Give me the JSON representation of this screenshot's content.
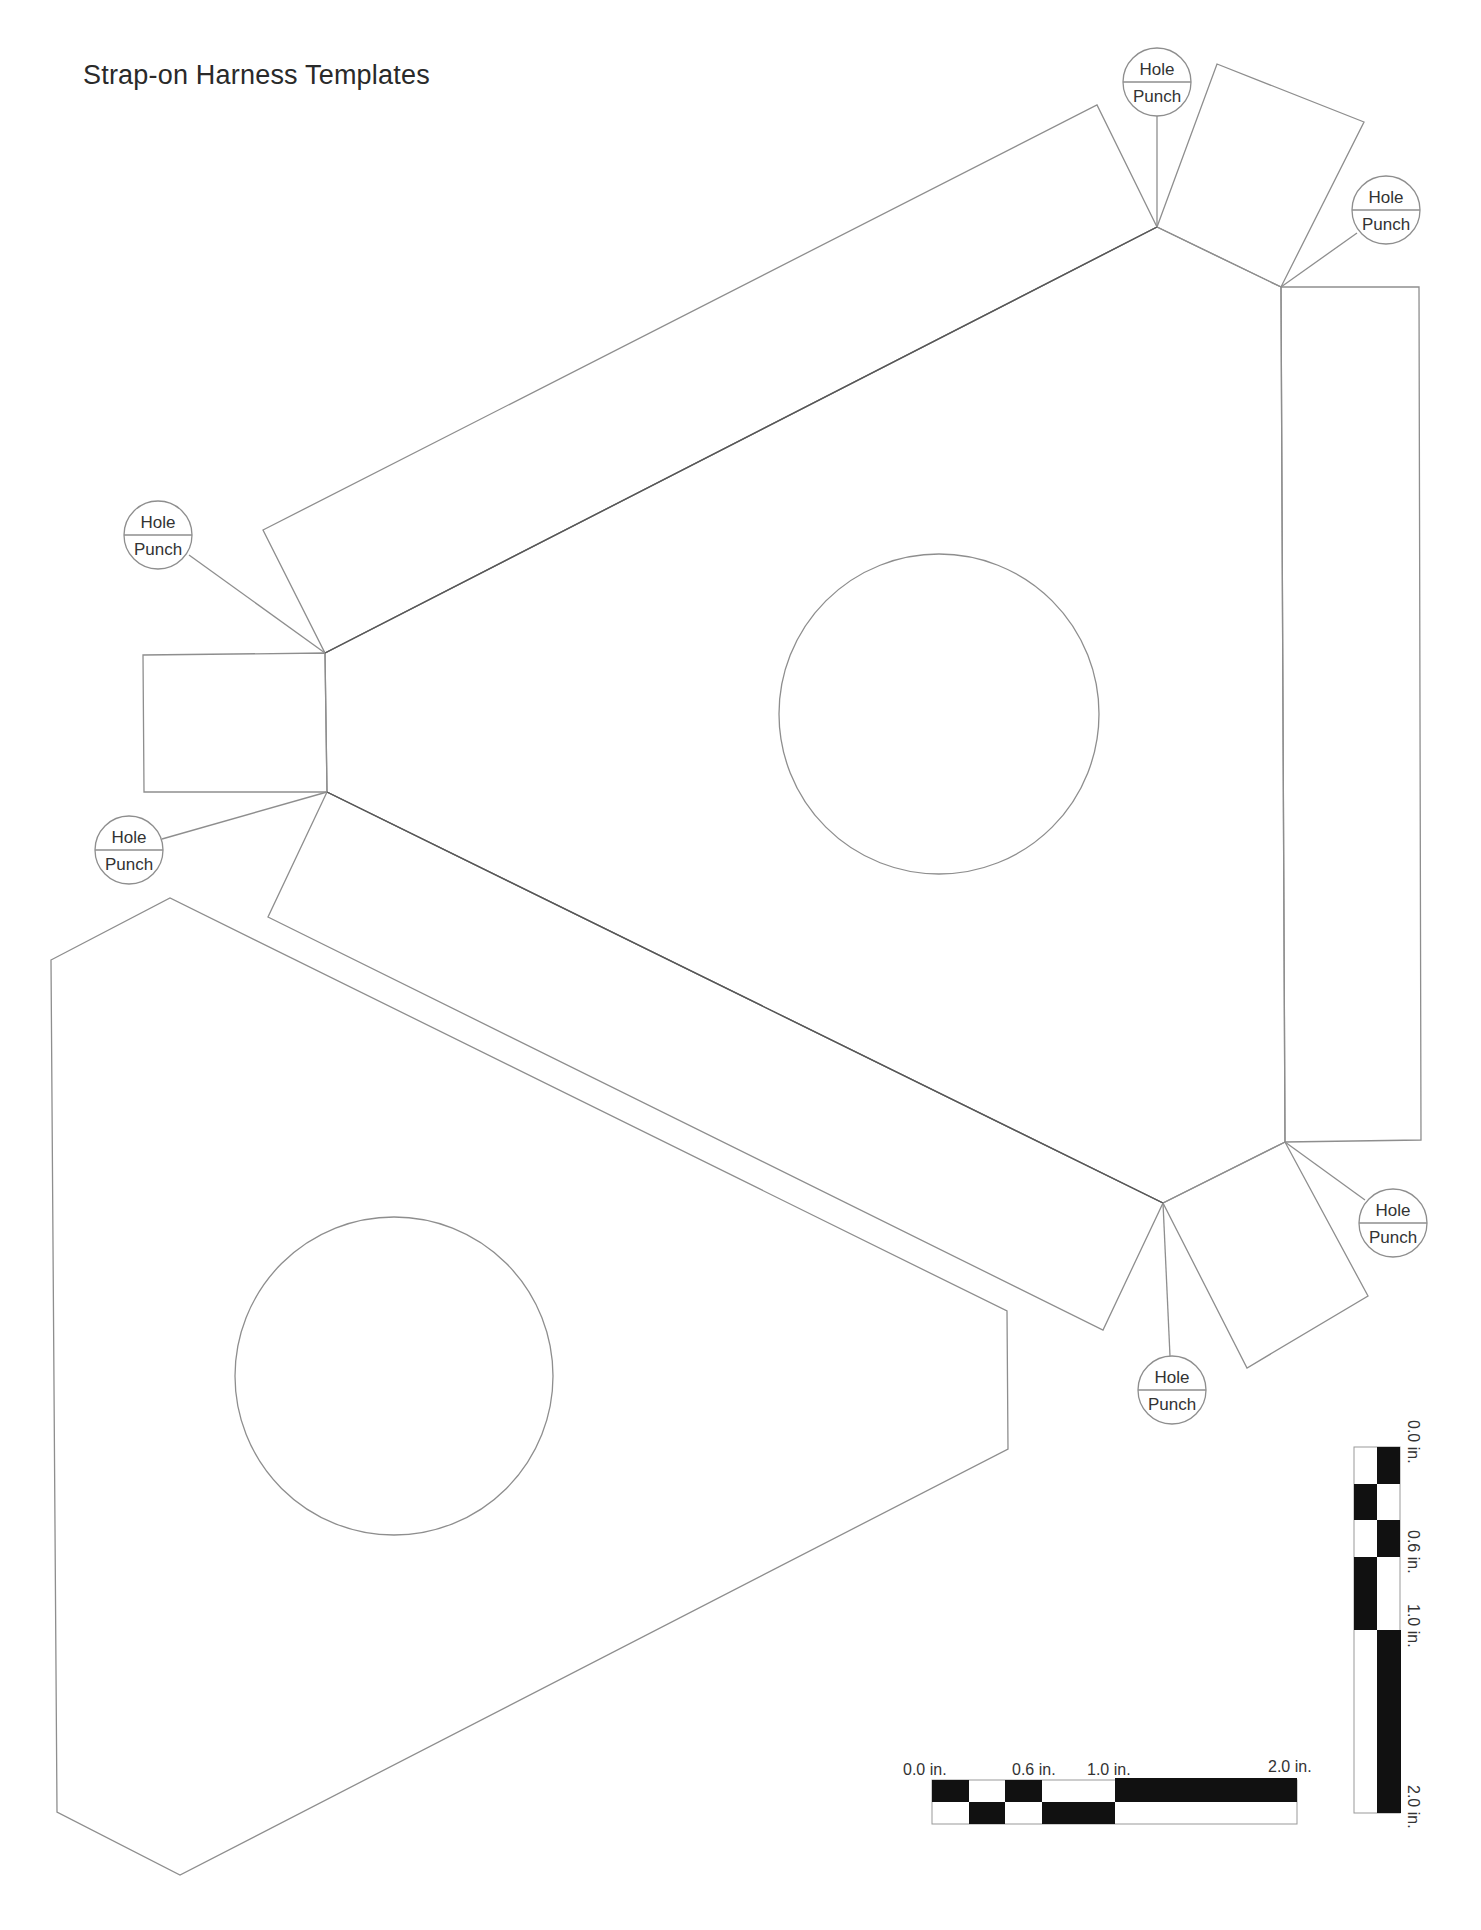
{
  "document": {
    "title": "Strap-on Harness Templates"
  },
  "hole_punch": {
    "line1": "Hole",
    "line2": "Punch",
    "markers": [
      {
        "cx": 1157,
        "cy": 82
      },
      {
        "cx": 1386,
        "cy": 210
      },
      {
        "cx": 158,
        "cy": 535
      },
      {
        "cx": 129,
        "cy": 850
      },
      {
        "cx": 1393,
        "cy": 1223
      },
      {
        "cx": 1172,
        "cy": 1390
      }
    ]
  },
  "horizontal_scale": {
    "labels": [
      "0.0 in.",
      "0.6 in.",
      "1.0 in.",
      "2.0 in."
    ]
  },
  "vertical_scale": {
    "labels": [
      "0.0 in.",
      "0.6 in.",
      "1.0 in.",
      "2.0 in."
    ]
  }
}
